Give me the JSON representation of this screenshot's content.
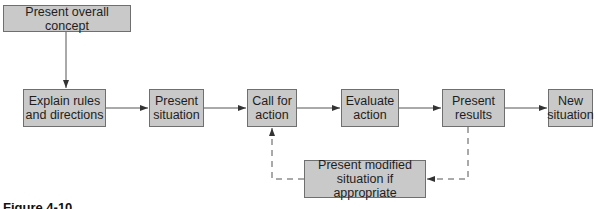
{
  "diagram": {
    "type": "flowchart",
    "nodes": [
      {
        "id": "concept",
        "label": "Present overall concept"
      },
      {
        "id": "rules",
        "label": "Explain rules and directions"
      },
      {
        "id": "situation",
        "label": "Present situation"
      },
      {
        "id": "call",
        "label": "Call for action"
      },
      {
        "id": "evaluate",
        "label": "Evaluate action"
      },
      {
        "id": "results",
        "label": "Present results"
      },
      {
        "id": "new",
        "label": "New situation"
      },
      {
        "id": "modified",
        "label": "Present modified situation if appropriate"
      }
    ],
    "edges": [
      {
        "from": "concept",
        "to": "rules",
        "style": "solid"
      },
      {
        "from": "rules",
        "to": "situation",
        "style": "solid"
      },
      {
        "from": "situation",
        "to": "call",
        "style": "solid"
      },
      {
        "from": "call",
        "to": "evaluate",
        "style": "solid"
      },
      {
        "from": "evaluate",
        "to": "results",
        "style": "solid"
      },
      {
        "from": "results",
        "to": "new",
        "style": "solid"
      },
      {
        "from": "results",
        "to": "modified",
        "style": "dashed"
      },
      {
        "from": "modified",
        "to": "call",
        "style": "dashed"
      }
    ],
    "labels": {
      "concept": "Present overall concept",
      "rules_l1": "Explain rules",
      "rules_l2": "and directions",
      "situation_l1": "Present",
      "situation_l2": "situation",
      "call_l1": "Call for",
      "call_l2": "action",
      "evaluate_l1": "Evaluate",
      "evaluate_l2": "action",
      "results_l1": "Present",
      "results_l2": "results",
      "new_l1": "New",
      "new_l2": "situation",
      "modified_l1": "Present modified",
      "modified_l2": "situation if appropriate"
    }
  },
  "caption": "Figure 4-10"
}
